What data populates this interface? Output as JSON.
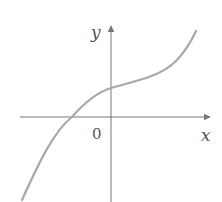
{
  "figure": {
    "type": "function-graph",
    "axes": {
      "x_label": "x",
      "y_label": "y",
      "origin_label": "0"
    },
    "colors": {
      "background": "#ffffff",
      "axis": "#777777",
      "curve": "#a8a8a8",
      "text": "#555555"
    }
  }
}
